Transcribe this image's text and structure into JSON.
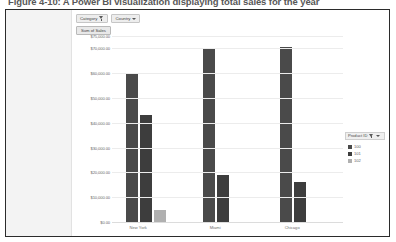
{
  "caption": "Figure 4-10: A Power BI visualization displaying total sales for the year",
  "toolbar": {
    "category_filter_label": "Category",
    "filter_icon": "funnel-icon",
    "country_filter_label": "Country",
    "caret_icon": "chevron-down-icon",
    "measure_label": "Sum of Sales"
  },
  "legend": {
    "title": "Product ID",
    "filter_icon": "funnel-icon",
    "caret_icon": "chevron-down-icon",
    "entries": [
      {
        "label": "100",
        "color": "#4a4a4a"
      },
      {
        "label": "101",
        "color": "#3d3d3d"
      },
      {
        "label": "102",
        "color": "#b0b0b0"
      }
    ]
  },
  "chart_data": {
    "type": "bar",
    "title": "",
    "xlabel": "",
    "ylabel": "",
    "categories": [
      "New York",
      "Miami",
      "Chicago"
    ],
    "series": [
      {
        "name": "100",
        "color": "#4a4a4a",
        "values": [
          60000.0,
          70000.0,
          70500.0
        ]
      },
      {
        "name": "101",
        "color": "#3d3d3d",
        "values": [
          43000.0,
          19000.0,
          16000.0
        ]
      },
      {
        "name": "102",
        "color": "#b0b0b0",
        "values": [
          5000.0,
          0,
          0
        ]
      }
    ],
    "ylim": [
      0,
      75000
    ],
    "yticks": [
      0,
      10000,
      20000,
      30000,
      40000,
      50000,
      60000,
      70000,
      75000
    ],
    "ytick_labels": [
      "$0.00",
      "$10,000.00",
      "$20,000.00",
      "$30,000.00",
      "$40,000.00",
      "$50,000.00",
      "$60,000.00",
      "$70,000.00",
      "$75,000.00"
    ],
    "grid": true,
    "legend_position": "right"
  }
}
